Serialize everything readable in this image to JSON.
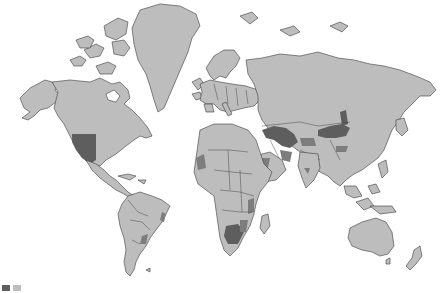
{
  "map": {
    "type": "world choropleth",
    "palette": {
      "ocean": "#ffffff",
      "base_land": "#bdbdbd",
      "category_medium": "#7d7d7d",
      "category_dark": "#5e5e5e",
      "borders": "#3a3a3a"
    },
    "highlighted_regions": [
      {
        "name": "Western United States",
        "shade": "dark"
      },
      {
        "name": "Central Asia / Kazakhstan",
        "shade": "dark"
      },
      {
        "name": "Mongolia / Northern China",
        "shade": "dark"
      },
      {
        "name": "Southern Africa (Botswana / Namibia)",
        "shade": "dark"
      },
      {
        "name": "Western Sahara / NW Africa",
        "shade": "medium"
      },
      {
        "name": "Arabian Peninsula",
        "shade": "medium"
      },
      {
        "name": "Iran / Afghanistan",
        "shade": "medium"
      },
      {
        "name": "Western China",
        "shade": "medium"
      },
      {
        "name": "East Africa",
        "shade": "medium"
      },
      {
        "name": "Eastern Brazil",
        "shade": "medium"
      },
      {
        "name": "Argentina",
        "shade": "medium"
      }
    ],
    "legend": {
      "visible": "partially cut off at bottom-left",
      "swatches": [
        "#5e5e5e",
        "#bdbdbd"
      ]
    }
  }
}
